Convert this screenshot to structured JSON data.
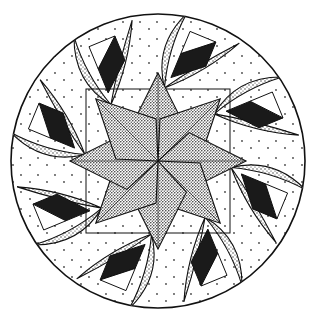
{
  "illustration": {
    "subject": "Quilt block: eight-pointed star within a circle, with feathered wedge motifs",
    "elements": {
      "central_star_points": 8,
      "feather_motifs": 8,
      "lens_arcs_per_motif": 2
    },
    "colors": {
      "background": "#ffffff",
      "ink": "#111111",
      "fill_solid": "#1a1a1a",
      "stipple_dense": "#222222",
      "stipple_light": "#555555"
    }
  }
}
